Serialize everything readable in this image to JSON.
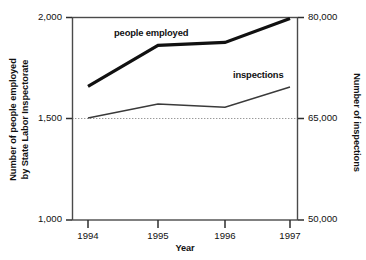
{
  "chart_data": {
    "type": "line",
    "title": "",
    "subtitle": "",
    "xlabel": "Year",
    "categories": [
      "1994",
      "1995",
      "1996",
      "1997"
    ],
    "grid": "single horizontal gridline at left 1,500 / right 65,000",
    "legend_position": "inline labels next to each series",
    "axes": {
      "left": {
        "label_line1": "Number of people employed",
        "label_line2": "by State Labor Inspectorate",
        "ticks": [
          "1,000",
          "1,500",
          "2,000"
        ],
        "tick_values": [
          1000,
          1500,
          2000
        ],
        "ylim": [
          1000,
          2000
        ]
      },
      "right": {
        "label": "Number of inspections",
        "ticks": [
          "50,000",
          "65,000",
          "80,000"
        ],
        "tick_values": [
          50000,
          65000,
          80000
        ],
        "ylim": [
          50000,
          80000
        ]
      },
      "x": {
        "label": "Year",
        "ticks": [
          "1994",
          "1995",
          "1996",
          "1997"
        ]
      }
    },
    "series": [
      {
        "name": "people employed",
        "axis": "left",
        "color": "#111111",
        "stroke_width": 3.2,
        "values": [
          1660,
          1862,
          1877,
          1995
        ]
      },
      {
        "name": "inspections",
        "axis": "right",
        "color": "#3a3a3a",
        "stroke_width": 1.5,
        "values": [
          65100,
          67200,
          66700,
          69700
        ]
      }
    ],
    "annotations": [
      {
        "text": "people employed",
        "x": 113,
        "y": 27
      },
      {
        "text": "inspections",
        "x": 232,
        "y": 69
      }
    ]
  },
  "colors": {
    "background": "#ffffff",
    "frame": "#4a4a4a",
    "text": "#111111",
    "series_employed": "#111111",
    "series_inspections": "#3a3a3a",
    "gridline": "#9a9a9a"
  }
}
